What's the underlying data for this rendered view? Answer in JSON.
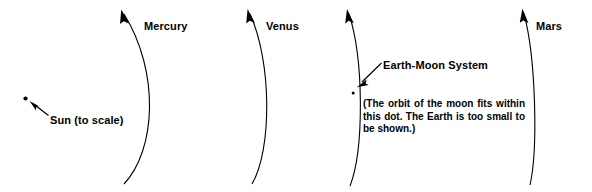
{
  "figure": {
    "title_alt": "Solar system orbits to scale",
    "background_color": "#ffffff",
    "ink_color": "#000000",
    "width": 592,
    "height": 192
  },
  "labels": {
    "mercury": "Mercury",
    "venus": "Venus",
    "mars": "Mars",
    "sun": "Sun (to scale)",
    "earth_moon": "Earth-Moon System",
    "earth_note": "(The orbit of the moon fits within this dot. The Earth is too small to be shown.)"
  },
  "orbits": [
    {
      "name": "mercury-orbit",
      "label": "Mercury"
    },
    {
      "name": "venus-orbit",
      "label": "Venus"
    },
    {
      "name": "earth-orbit",
      "label": "Earth-Moon System"
    },
    {
      "name": "mars-orbit",
      "label": "Mars"
    }
  ],
  "markers": {
    "sun_dot": "sun-dot",
    "earth_dot": "earth-moon-dot"
  }
}
